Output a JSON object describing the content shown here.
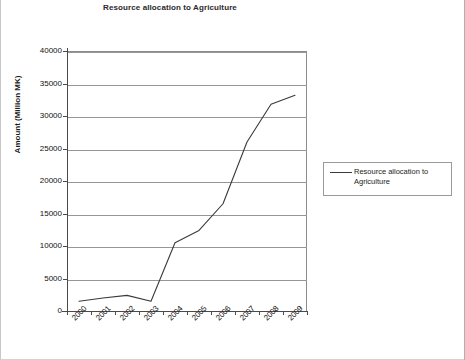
{
  "chart_data": {
    "type": "line",
    "title": "Resource allocation to Agriculture",
    "xlabel": "",
    "ylabel": "Amount (Million MK)",
    "categories": [
      "2000",
      "2001",
      "2002",
      "2003",
      "2004",
      "2005",
      "2006",
      "2007",
      "2008",
      "2009"
    ],
    "series": [
      {
        "name": "Resource allocation to Agriculture",
        "color": "#3a3a3a",
        "values": [
          1500,
          2000,
          2400,
          1500,
          10500,
          12400,
          16500,
          26000,
          31800,
          33200
        ]
      }
    ],
    "ylim": [
      0,
      40000
    ],
    "y_ticks": [
      0,
      5000,
      10000,
      15000,
      20000,
      25000,
      30000,
      35000,
      40000
    ],
    "y_tick_labels": [
      "0",
      "5000",
      "10000",
      "15000",
      "20000",
      "25000",
      "30000",
      "35000",
      "40000"
    ],
    "grid": "horizontal",
    "legend_position": "right",
    "legend_entries": [
      "Resource allocation to Agriculture"
    ]
  },
  "legend": {
    "label_line_1": "Resource allocation to",
    "label_line_2": "Agriculture"
  },
  "icons": {
    "legend_line": "line-marker-icon"
  }
}
